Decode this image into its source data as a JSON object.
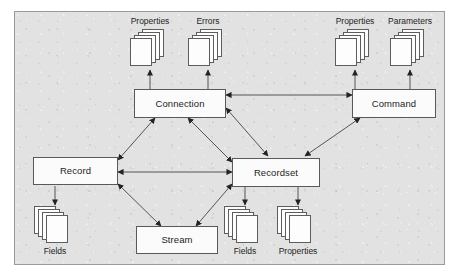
{
  "diagram": {
    "colors": {
      "panel_background": "#e2e2e2",
      "panel_border": "#9a9a9a",
      "node_fill": "#fbfbfb",
      "node_border": "#59595b",
      "connector": "#4a4a4a",
      "text": "#1d1d1d"
    },
    "nodes": [
      {
        "id": "connection",
        "label": "Connection"
      },
      {
        "id": "command",
        "label": "Command"
      },
      {
        "id": "record",
        "label": "Record"
      },
      {
        "id": "recordset",
        "label": "Recordset"
      },
      {
        "id": "stream",
        "label": "Stream"
      }
    ],
    "collections": [
      {
        "id": "connection-properties",
        "label": "Properties",
        "owner": "connection",
        "position": "above"
      },
      {
        "id": "connection-errors",
        "label": "Errors",
        "owner": "connection",
        "position": "above"
      },
      {
        "id": "command-properties",
        "label": "Properties",
        "owner": "command",
        "position": "above"
      },
      {
        "id": "command-parameters",
        "label": "Parameters",
        "owner": "command",
        "position": "above"
      },
      {
        "id": "record-fields",
        "label": "Fields",
        "owner": "record",
        "position": "below"
      },
      {
        "id": "recordset-fields",
        "label": "Fields",
        "owner": "recordset",
        "position": "below"
      },
      {
        "id": "recordset-properties",
        "label": "Properties",
        "owner": "recordset",
        "position": "below"
      }
    ],
    "links": [
      {
        "from": "connection",
        "to": "command",
        "arrows": "both"
      },
      {
        "from": "connection",
        "to": "record",
        "arrows": "both"
      },
      {
        "from": "connection",
        "to": "recordset",
        "arrows": "both"
      },
      {
        "from": "command",
        "to": "recordset",
        "arrows": "both"
      },
      {
        "from": "record",
        "to": "recordset",
        "arrows": "both"
      },
      {
        "from": "record",
        "to": "stream",
        "arrows": "both"
      },
      {
        "from": "recordset",
        "to": "stream",
        "arrows": "both"
      },
      {
        "from": "connection",
        "to": "connection-properties",
        "arrows": "single"
      },
      {
        "from": "connection",
        "to": "connection-errors",
        "arrows": "single"
      },
      {
        "from": "command",
        "to": "command-properties",
        "arrows": "single"
      },
      {
        "from": "command",
        "to": "command-parameters",
        "arrows": "single"
      },
      {
        "from": "record",
        "to": "record-fields",
        "arrows": "single"
      },
      {
        "from": "recordset",
        "to": "recordset-fields",
        "arrows": "single"
      },
      {
        "from": "recordset",
        "to": "recordset-properties",
        "arrows": "single"
      }
    ]
  }
}
